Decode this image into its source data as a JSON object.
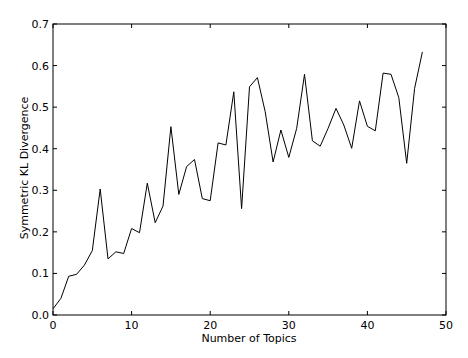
{
  "chart_data": {
    "type": "line",
    "title": "",
    "xlabel": "Number of Topics",
    "ylabel": "Symmetric KL Divergence",
    "xlim": [
      0,
      50
    ],
    "ylim": [
      0.0,
      0.7
    ],
    "xticks": [
      0,
      10,
      20,
      30,
      40,
      50
    ],
    "xtick_labels": [
      "0",
      "10",
      "20",
      "30",
      "40",
      "50"
    ],
    "yticks": [
      0.0,
      0.1,
      0.2,
      0.3,
      0.4,
      0.5,
      0.6,
      0.7
    ],
    "ytick_labels": [
      "0.0",
      "0.1",
      "0.2",
      "0.3",
      "0.4",
      "0.5",
      "0.6",
      "0.7"
    ],
    "grid": false,
    "legend": null,
    "series": [
      {
        "name": "Symmetric KL Divergence",
        "color": "#000000",
        "x": [
          0,
          1,
          2,
          3,
          4,
          5,
          6,
          7,
          8,
          9,
          10,
          11,
          12,
          13,
          14,
          15,
          16,
          17,
          18,
          19,
          20,
          21,
          22,
          23,
          24,
          25,
          26,
          27,
          28,
          29,
          30,
          31,
          32,
          33,
          34,
          35,
          36,
          37,
          38,
          39,
          40,
          41,
          42,
          43,
          44,
          45,
          46,
          47
        ],
        "values": [
          0.015,
          0.04,
          0.093,
          0.098,
          0.12,
          0.155,
          0.303,
          0.135,
          0.152,
          0.148,
          0.208,
          0.198,
          0.317,
          0.222,
          0.262,
          0.453,
          0.29,
          0.357,
          0.374,
          0.28,
          0.275,
          0.414,
          0.409,
          0.537,
          0.256,
          0.549,
          0.571,
          0.489,
          0.368,
          0.445,
          0.379,
          0.449,
          0.579,
          0.419,
          0.406,
          0.449,
          0.497,
          0.457,
          0.401,
          0.515,
          0.454,
          0.443,
          0.582,
          0.579,
          0.523,
          0.365,
          0.545,
          0.633
        ]
      }
    ]
  }
}
